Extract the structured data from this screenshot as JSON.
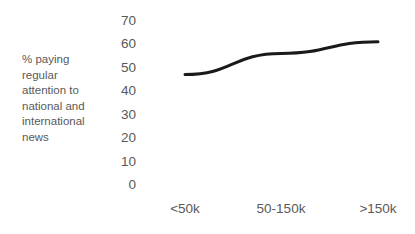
{
  "chart_data": {
    "type": "line",
    "title": "",
    "subtitle": "",
    "xlabel": "",
    "ylabel": "% paying regular attention to national and international news",
    "categories": [
      "<50k",
      "50-150k",
      ">150k"
    ],
    "values": [
      47,
      56,
      61
    ],
    "series": [
      {
        "name": "% paying regular attention to national and international news",
        "values": [
          47,
          56,
          61
        ]
      }
    ],
    "ylim": [
      0,
      70
    ],
    "y_ticks": [
      70,
      60,
      50,
      40,
      30,
      20,
      10,
      0
    ],
    "grid": false,
    "legend": false,
    "legend_position": "none",
    "markers": false,
    "axis_lines": false,
    "annotations": []
  },
  "style": {
    "line_color": "#1a1a1a",
    "text_color": "#595959",
    "background": "#ffffff",
    "line_width": 3
  }
}
